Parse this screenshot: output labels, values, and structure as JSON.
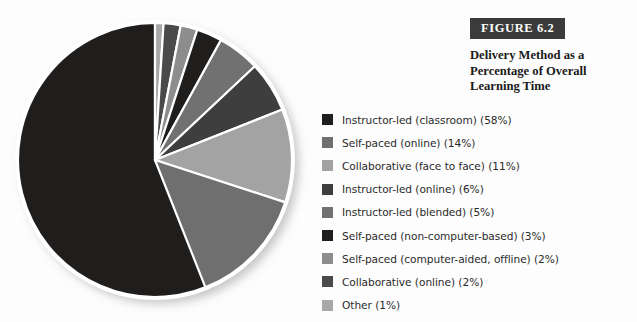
{
  "figure": {
    "badge_label": "FIGURE 6.2",
    "caption": "Delivery Method as a Percentage of Overall Learning Time",
    "badge_bg": "#3b3b3b",
    "badge_text_color": "#ffffff"
  },
  "chart_data": {
    "type": "pie",
    "title": "Delivery Method as a Percentage of Overall Learning Time",
    "unit": "percent",
    "legend_position": "right",
    "start_angle_deg": 0,
    "large_slice_direction": "counter-clockwise",
    "categories": [
      "Instructor-led (classroom)",
      "Self-paced (online)",
      "Collaborative (face to face)",
      "Instructor-led (online)",
      "Instructor-led (blended)",
      "Self-paced (non-computer-based)",
      "Self-paced (computer-aided, offline)",
      "Collaborative (online)",
      "Other"
    ],
    "values": [
      58,
      14,
      11,
      6,
      5,
      3,
      2,
      2,
      1
    ],
    "colors": [
      "#201d1d",
      "#6f6f6f",
      "#a3a3a3",
      "#3e3e3e",
      "#717171",
      "#201d1d",
      "#8d8d8d",
      "#4a4a4a",
      "#a8a8a8"
    ],
    "labels": [
      "Instructor-led (classroom) (58%)",
      "Self-paced (online) (14%)",
      "Collaborative (face to face) (11%)",
      "Instructor-led (online) (6%)",
      "Instructor-led (blended) (5%)",
      "Self-paced (non-computer-based) (3%)",
      "Self-paced (computer-aided, offline) (2%)",
      "Collaborative (online) (2%)",
      "Other (1%)"
    ]
  }
}
